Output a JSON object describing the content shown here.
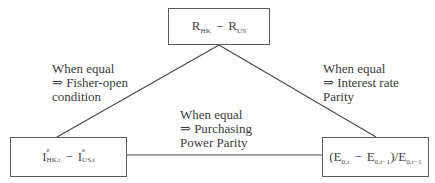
{
  "diagram": {
    "nodes": {
      "top": {
        "base1": "R",
        "sub1": "HK",
        "op": "−",
        "base2": "R",
        "sub2": "US"
      },
      "left": {
        "base1": "I",
        "sup1": "e",
        "sub1": "HK,t",
        "op": "−",
        "base2": "I",
        "sup2": "e",
        "sub2": "US,t"
      },
      "right": {
        "open": "(E",
        "sub1": "0,t",
        "op": "−",
        "base2": "E",
        "sub2": "0,t−1",
        "close": ")/E",
        "sub3": "0,t−1"
      }
    },
    "edges": {
      "top_left": {
        "line1": "When equal",
        "line2": "⇒ Fisher-open",
        "line3": "condition"
      },
      "top_right": {
        "line1": "When equal",
        "line2": "⇒ Interest rate",
        "line3": "Parity"
      },
      "left_right": {
        "line1": "When equal",
        "line2": "⇒ Purchasing",
        "line3": "Power Parity"
      }
    },
    "colors": {
      "line": "#4a4a4a",
      "border": "#5a5a5a",
      "text": "#3a3a3a"
    }
  }
}
